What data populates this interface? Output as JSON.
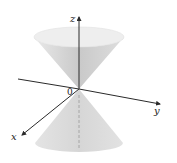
{
  "figure": {
    "axes": {
      "x_label": "x",
      "y_label": "y",
      "z_label": "z",
      "origin_label": "0"
    },
    "colors": {
      "axis": "#2a2a2a",
      "cone_fill_light": "#ececec",
      "cone_fill_mid": "#d4d4d4",
      "cone_fill_dark": "#bdbdbd",
      "rim": "#e6e6e6"
    }
  }
}
